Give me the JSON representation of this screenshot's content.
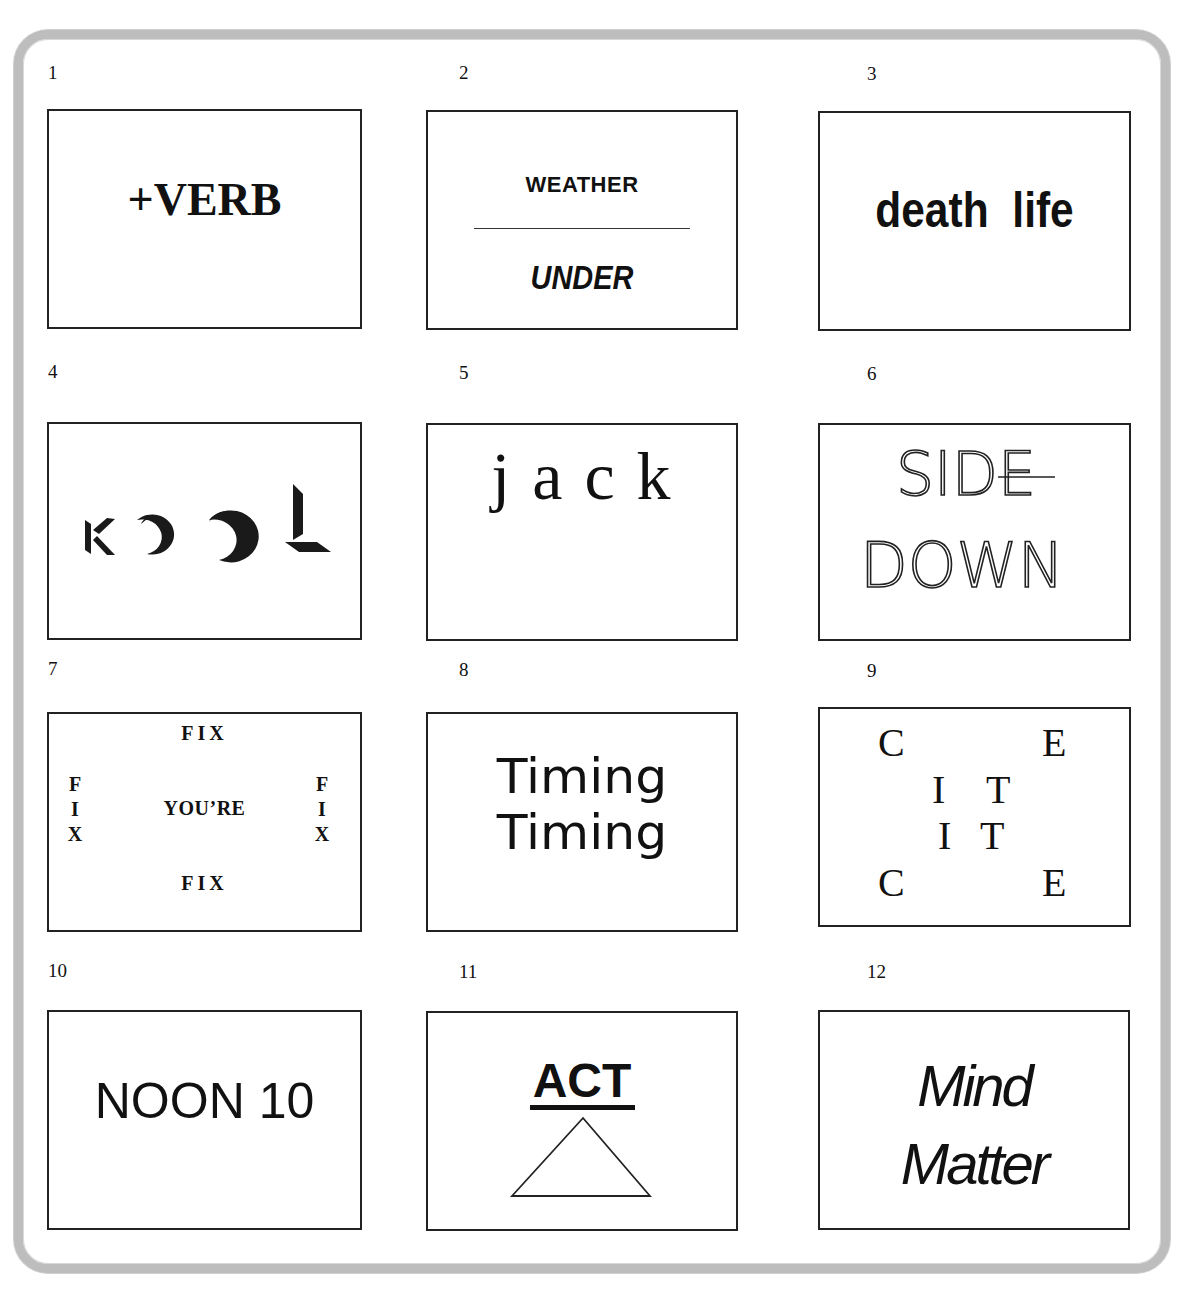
{
  "puzzles": [
    {
      "number": "1",
      "text": "+VERB"
    },
    {
      "number": "2",
      "top": "WEATHER",
      "bottom": "UNDER"
    },
    {
      "number": "3",
      "text": "death  life"
    },
    {
      "number": "4",
      "text": "KOOL",
      "letters": [
        "K",
        "O",
        "O",
        "L"
      ]
    },
    {
      "number": "5",
      "text": "jack"
    },
    {
      "number": "6",
      "line1": "SIDE",
      "line2": "DOWN"
    },
    {
      "number": "7",
      "top": "FIX",
      "bottom": "FIX",
      "left": [
        "F",
        "I",
        "X"
      ],
      "right": [
        "F",
        "I",
        "X"
      ],
      "center": "YOU’RE"
    },
    {
      "number": "8",
      "line1": "Timing",
      "line2": "Timing"
    },
    {
      "number": "9",
      "letters": {
        "r1c1": "C",
        "r1c2": "E",
        "r2c1": "I",
        "r2c2": "T",
        "r3c1": "I",
        "r3c2": "T",
        "r4c1": "C",
        "r4c2": "E"
      }
    },
    {
      "number": "10",
      "text": "NOON 10"
    },
    {
      "number": "11",
      "text": "ACT",
      "shape": "triangle"
    },
    {
      "number": "12",
      "line1": "Mind",
      "line2": "Matter"
    }
  ],
  "colors": {
    "frame": "#bdbdbd",
    "ink": "#111111",
    "background": "#ffffff"
  }
}
